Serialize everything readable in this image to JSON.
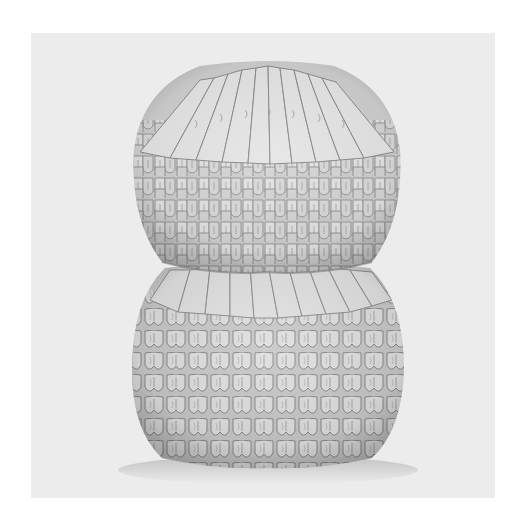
{
  "image": {
    "subject": "3D origami sculpture, two stacked rounded tiers of folded paper units",
    "alt": "Grayscale photograph of a white modular origami sculpture shaped like two stacked spheres",
    "colors": {
      "border": "#ffffff",
      "backdrop": "#ebebeb",
      "paper_light": "#e2e2e2",
      "paper_mid": "#c4c4c4",
      "paper_shadow": "#8e8e8e",
      "crease": "#6f6f6f"
    },
    "frame": {
      "x": 31,
      "y": 33,
      "width": 464,
      "height": 465
    },
    "sculpture": {
      "upper_tier": {
        "cx": 267,
        "top": 64,
        "bottom": 270,
        "left": 134,
        "right": 400
      },
      "lower_tier": {
        "cx": 268,
        "top": 262,
        "bottom": 465,
        "left": 132,
        "right": 404
      }
    }
  }
}
